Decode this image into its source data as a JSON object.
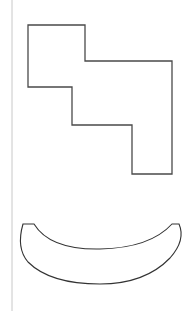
{
  "canvas": {
    "width": 189,
    "height": 311,
    "background": "#ffffff"
  },
  "margin_line": {
    "x": 12,
    "color": "#c8c8c8",
    "width": 1
  },
  "shapes": [
    {
      "name": "staircase-polygon",
      "type": "polygon",
      "stroke": "#4a4a4a",
      "stroke_width": 1.3,
      "points": "28,25 85,25 85,61 172,61 172,174 132,174 132,125 72,125 72,87 28,87"
    },
    {
      "name": "crescent-shape",
      "type": "path",
      "stroke": "#333333",
      "stroke_width": 1.1,
      "d": "M 23,224 L 34,224 Q 50,250 100,249 Q 150,248 172,224 L 179,224 Q 186,240 170,258 Q 145,284 100,284 Q 50,284 28,262 Q 16,248 23,224 Z"
    }
  ]
}
